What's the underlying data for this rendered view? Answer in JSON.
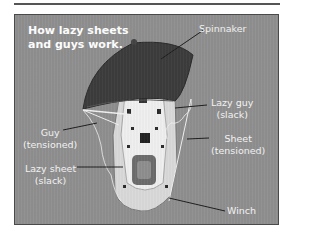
{
  "title": "How lazy sheets\nand guys work.",
  "labels": {
    "spinnaker": "Spinnaker",
    "lazy_guy": "Lazy guy\n(slack)",
    "guy": "Guy\n(tensioned)",
    "sheet": "Sheet\n(tensioned)",
    "lazy_sheet": "Lazy sheet\n(slack)",
    "winch": "Winch"
  },
  "colors": {
    "panel": "#8f8f8f",
    "sail": "#3c3c3c",
    "boat": "#e6e6e6",
    "label_text": "#ffffff",
    "leader_line": "#1e1e1e"
  }
}
